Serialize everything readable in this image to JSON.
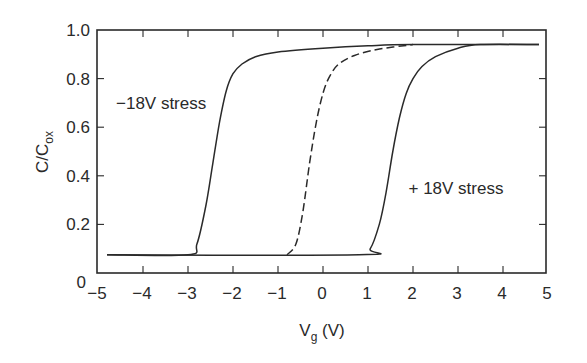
{
  "chart_data": {
    "type": "line",
    "title": "",
    "xlabel": "V_g (V)",
    "xlabel_main": "V",
    "xlabel_sub": "g",
    "xlabel_unit": " (V)",
    "ylabel": "C/C_ox",
    "ylabel_main": "C/C",
    "ylabel_sub": "ox",
    "xlim": [
      -5,
      5
    ],
    "ylim": [
      0,
      1.0
    ],
    "x_ticks": [
      -5,
      -4,
      -3,
      -2,
      -1,
      0,
      1,
      2,
      3,
      4,
      5
    ],
    "x_tick_labels": [
      "−5",
      "−4",
      "−3",
      "−2",
      "−1",
      "0",
      "1",
      "2",
      "3",
      "4",
      "5"
    ],
    "y_ticks": [
      0,
      0.2,
      0.4,
      0.6,
      0.8,
      1.0
    ],
    "y_tick_labels": [
      "0",
      "0.2",
      "0.4",
      "0.6",
      "0.8",
      "1.0"
    ],
    "grid": false,
    "legend": "none (inline annotations)",
    "annotations": [
      {
        "text": "−18V stress",
        "x": -4.6,
        "y": 0.7
      },
      {
        "text": "+ 18V stress",
        "x": 1.9,
        "y": 0.35
      }
    ],
    "series": [
      {
        "name": "−18V stress",
        "style": "solid",
        "x": [
          -4.8,
          -3.0,
          -2.8,
          -2.6,
          -2.45,
          -2.3,
          -2.15,
          -2.0,
          -1.8,
          -1.5,
          -1.0,
          0.0,
          1.0,
          2.0,
          4.8
        ],
        "y": [
          0.075,
          0.075,
          0.12,
          0.28,
          0.45,
          0.62,
          0.75,
          0.82,
          0.86,
          0.89,
          0.91,
          0.925,
          0.935,
          0.94,
          0.94
        ]
      },
      {
        "name": "unstressed",
        "style": "dashed",
        "x": [
          -0.8,
          -0.6,
          -0.45,
          -0.3,
          -0.15,
          0.0,
          0.15,
          0.35,
          0.7,
          1.2,
          2.0
        ],
        "y": [
          0.075,
          0.12,
          0.25,
          0.45,
          0.62,
          0.74,
          0.81,
          0.86,
          0.895,
          0.92,
          0.94
        ]
      },
      {
        "name": "+ 18V stress",
        "style": "solid",
        "x": [
          -4.8,
          0.8,
          1.05,
          1.25,
          1.4,
          1.55,
          1.7,
          1.85,
          2.0,
          2.2,
          2.5,
          3.0,
          3.5,
          4.8
        ],
        "y": [
          0.075,
          0.075,
          0.1,
          0.2,
          0.33,
          0.5,
          0.64,
          0.74,
          0.8,
          0.85,
          0.89,
          0.925,
          0.94,
          0.94
        ]
      }
    ],
    "colors": {
      "line": "#2a2a2a",
      "axis": "#2a2a2a",
      "background": "#ffffff"
    }
  }
}
